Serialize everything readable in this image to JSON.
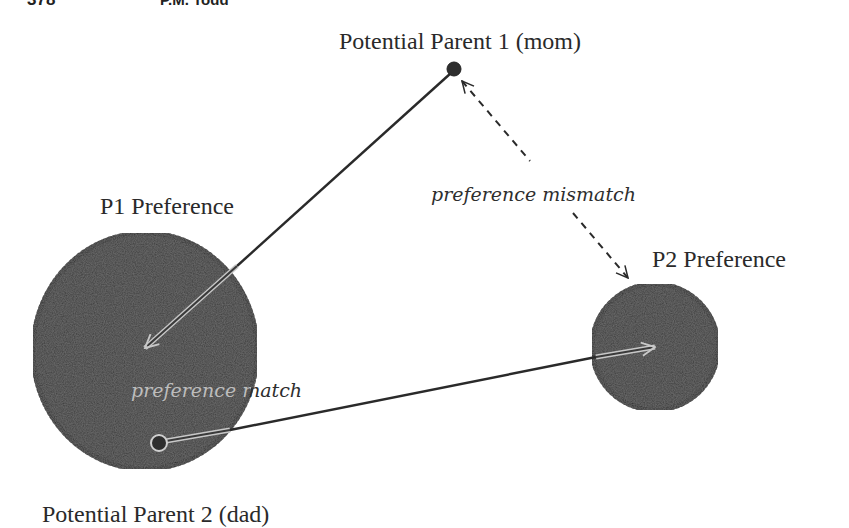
{
  "page_header": {
    "page_number": "378",
    "running_head": "P.M. Todd"
  },
  "diagram": {
    "title": "",
    "nodes": {
      "parent1": {
        "label": "Potential Parent 1 (mom)",
        "x": 454,
        "y": 69
      },
      "parent2": {
        "label": "Potential Parent 2 (dad)",
        "x": 159,
        "y": 443
      },
      "p1_pref": {
        "label": "P1 Preference",
        "cx": 145,
        "cy": 351,
        "rx": 112,
        "ry": 118
      },
      "p2_pref": {
        "label": "P2 Preference",
        "cx": 655,
        "cy": 347,
        "r": 63
      }
    },
    "edges": {
      "parent1_to_p1pref": {
        "style": "solid",
        "label": ""
      },
      "parent2_to_p2pref": {
        "style": "solid",
        "label": ""
      },
      "mismatch": {
        "style": "dashed",
        "label": "preference mismatch"
      },
      "match": {
        "label": "preference match"
      }
    },
    "colors": {
      "blob_fill": "#3a3a3a",
      "blob_edge": "#2a2a2a",
      "line": "#2a2a2a",
      "background": "#ffffff"
    }
  }
}
